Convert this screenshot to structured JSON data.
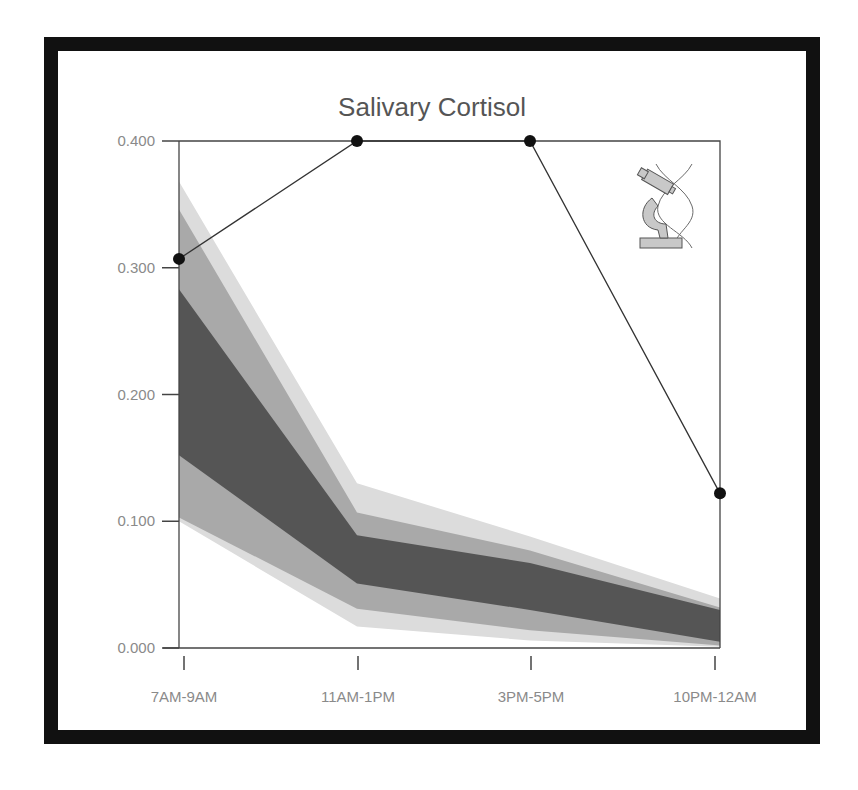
{
  "chart_data": {
    "type": "area",
    "title": "Salivary Cortisol",
    "xlabel": "",
    "ylabel": "",
    "categories": [
      "7AM-9AM",
      "11AM-1PM",
      "3PM-5PM",
      "10PM-12AM"
    ],
    "ylim": [
      0,
      0.4
    ],
    "yticks": [
      "0.000",
      "0.100",
      "0.200",
      "0.300",
      "0.400"
    ],
    "grid": false,
    "legend": null,
    "reference_bands": [
      {
        "name": "outer-range",
        "color": "#dcdcdc",
        "upper": [
          0.368,
          0.13,
          0.088,
          0.039
        ],
        "lower": [
          0.1,
          0.017,
          0.006,
          0.001
        ]
      },
      {
        "name": "middle-range",
        "color": "#a9a9a9",
        "upper": [
          0.346,
          0.107,
          0.077,
          0.032
        ],
        "lower": [
          0.103,
          0.031,
          0.014,
          0.002
        ]
      },
      {
        "name": "inner-range",
        "color": "#555555",
        "upper": [
          0.283,
          0.089,
          0.067,
          0.03
        ],
        "lower": [
          0.152,
          0.051,
          0.03,
          0.005
        ]
      }
    ],
    "series": [
      {
        "name": "Patient",
        "values": [
          0.307,
          0.4,
          0.4,
          0.122
        ],
        "color": "#111111"
      }
    ]
  },
  "icons": {
    "corner_icon": "microscope-dna-icon"
  },
  "colors": {
    "frame": "#111111",
    "line": "#333333",
    "text": "#8a8a8a",
    "title": "#555555"
  }
}
